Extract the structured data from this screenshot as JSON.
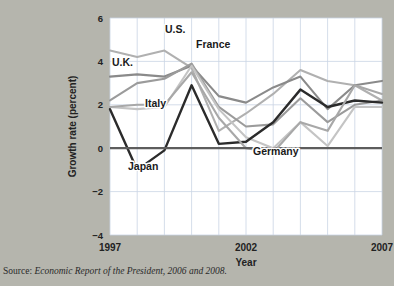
{
  "figure": {
    "background_color": "#b5b5ad",
    "plot_background": "#ffffff",
    "source_prefix": "Source: ",
    "source_italic": "Economic Report of the President, 2006 and 2008."
  },
  "chart_data": {
    "type": "line",
    "title": "",
    "xlabel": "Year",
    "ylabel": "Growth rate (percent)",
    "x": [
      1997,
      1998,
      1999,
      2000,
      2001,
      2002,
      2003,
      2004,
      2005,
      2006,
      2007
    ],
    "xlim": [
      1997,
      2007
    ],
    "ylim": [
      -4,
      6
    ],
    "xticks": [
      1997,
      2002,
      2007
    ],
    "xtick_labels": [
      "1997",
      "2002",
      "2007"
    ],
    "yticks": [
      -4,
      -2,
      0,
      2,
      4,
      6
    ],
    "ytick_labels": [
      "−4",
      "−2",
      "0",
      "2",
      "4",
      "6"
    ],
    "grid": true,
    "zero_line": true,
    "legend": "inline-annotations",
    "series": [
      {
        "name": "U.S.",
        "color": "#b0b0b0",
        "width": 2.1,
        "values": [
          4.5,
          4.2,
          4.5,
          3.7,
          0.8,
          1.6,
          2.5,
          3.6,
          3.1,
          2.9,
          2.2
        ]
      },
      {
        "name": "U.K.",
        "color": "#8a8a8a",
        "width": 2.1,
        "values": [
          3.3,
          3.4,
          3.3,
          3.8,
          2.4,
          2.1,
          2.8,
          3.3,
          1.8,
          2.9,
          3.1
        ]
      },
      {
        "name": "France",
        "color": "#9b9b9b",
        "width": 2.1,
        "values": [
          2.2,
          3.0,
          3.2,
          3.9,
          1.9,
          1.0,
          1.1,
          2.3,
          1.2,
          2.0,
          2.2
        ]
      },
      {
        "name": "Italy",
        "color": "#c4c4c4",
        "width": 2.1,
        "values": [
          1.9,
          1.8,
          1.9,
          3.8,
          1.8,
          0.5,
          0.0,
          1.2,
          0.1,
          1.9,
          1.9
        ]
      },
      {
        "name": "Japan",
        "color": "#2b2b2b",
        "width": 2.4,
        "values": [
          1.8,
          -1.0,
          -0.1,
          2.9,
          0.2,
          0.3,
          1.2,
          2.7,
          1.9,
          2.2,
          2.1
        ]
      },
      {
        "name": "Germany",
        "color": "#a8a8a8",
        "width": 2.1,
        "values": [
          1.9,
          2.0,
          2.0,
          3.5,
          1.4,
          0.0,
          -0.2,
          1.2,
          0.8,
          2.9,
          2.5
        ]
      }
    ],
    "annotations": [
      {
        "label": "U.S.",
        "x": 165,
        "y": 33
      },
      {
        "label": "U.K.",
        "x": 112,
        "y": 66
      },
      {
        "label": "France",
        "x": 196,
        "y": 48
      },
      {
        "label": "Italy",
        "x": 145,
        "y": 107
      },
      {
        "label": "Japan",
        "x": 128,
        "y": 170
      },
      {
        "label": "Germany",
        "x": 253,
        "y": 155
      }
    ]
  }
}
